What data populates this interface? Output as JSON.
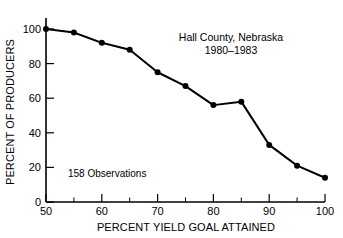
{
  "chart_data": {
    "type": "line",
    "title": "",
    "xlabel": "PERCENT YIELD GOAL ATTAINED",
    "ylabel": "PERCENT OF PRODUCERS",
    "xlim": [
      50,
      100
    ],
    "ylim": [
      0,
      100
    ],
    "xticks": [
      50,
      60,
      70,
      80,
      90,
      100
    ],
    "xticklabels": [
      "50",
      "60",
      "70",
      "80",
      "90",
      "100"
    ],
    "xminorticks": [
      55,
      65,
      75,
      85,
      95
    ],
    "yticks": [
      0,
      20,
      40,
      60,
      80,
      100
    ],
    "yticklabels": [
      "0",
      "20",
      "40",
      "60",
      "80",
      "100"
    ],
    "grid": false,
    "legend": false,
    "marker": "filled-circle",
    "line_color": "#000000",
    "marker_color": "#000000",
    "x": [
      50,
      55,
      60,
      65,
      70,
      75,
      80,
      85,
      90,
      95,
      100
    ],
    "values": [
      100,
      98,
      92,
      88,
      75,
      67,
      56,
      58,
      33,
      21,
      14
    ],
    "series": [
      {
        "name": "Percent of producers attaining yield goal",
        "x": [
          50,
          55,
          60,
          65,
          70,
          75,
          80,
          85,
          90,
          95,
          100
        ],
        "values": [
          100,
          98,
          92,
          88,
          75,
          67,
          56,
          58,
          33,
          21,
          14
        ]
      }
    ],
    "annotations": [
      {
        "id": "location",
        "text": "Hall County, Nebraska"
      },
      {
        "id": "years",
        "text": "1980–1983"
      },
      {
        "id": "observations",
        "text": "158 Observations"
      }
    ]
  },
  "annotations": {
    "location": "Hall County, Nebraska",
    "years": "1980–1983",
    "observations": "158 Observations"
  },
  "axes": {
    "x_title": "PERCENT YIELD GOAL ATTAINED",
    "y_title": "PERCENT OF PRODUCERS",
    "x_labels": [
      "50",
      "60",
      "70",
      "80",
      "90",
      "100"
    ],
    "y_labels": [
      "0",
      "20",
      "40",
      "60",
      "80",
      "100"
    ]
  }
}
